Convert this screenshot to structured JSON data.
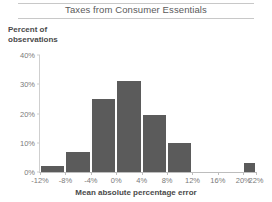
{
  "chart_data": {
    "type": "bar",
    "title": "Taxes from Consumer Essentials",
    "xlabel": "Mean absolute percentage error",
    "ylabel": "Percent of observations",
    "ylabel_line1": "Percent of",
    "ylabel_line2": "observations",
    "grid": false,
    "legend": null,
    "ylim": [
      0,
      40
    ],
    "xlim": [
      -12,
      22
    ],
    "ytick_labels": [
      "0%",
      "10%",
      "20%",
      "30%",
      "40%"
    ],
    "ytick_values": [
      0,
      10,
      20,
      30,
      40
    ],
    "xtick_labels": [
      "-12%",
      "-8%",
      "-4%",
      "0%",
      "4%",
      "8%",
      "12%",
      "16%",
      "20%",
      "22%"
    ],
    "xtick_values": [
      -12,
      -8,
      -4,
      0,
      4,
      8,
      12,
      16,
      20,
      22
    ],
    "bin_width": 4,
    "categories": [
      "-12% to -8%",
      "-8% to -4%",
      "-4% to 0%",
      "0% to 4%",
      "4% to 8%",
      "8% to 12%",
      "12% to 16%",
      "16% to 20%",
      "20% to 22%"
    ],
    "bin_starts": [
      -12,
      -8,
      -4,
      0,
      4,
      8,
      12,
      16,
      20
    ],
    "bin_ends": [
      -8,
      -4,
      0,
      4,
      8,
      12,
      16,
      20,
      22
    ],
    "values": [
      2,
      7,
      25,
      31,
      19.5,
      10,
      0,
      0,
      3
    ],
    "bar_color": "#5b5b5b"
  },
  "colors": {
    "bar": "#5b5b5b",
    "axis": "#bdbdbd",
    "tick_text": "#7a7a7a",
    "title_text": "#5a5a5a",
    "label_text": "#4a4a4a",
    "rule": "#c8c8c8",
    "background": "#ffffff"
  }
}
